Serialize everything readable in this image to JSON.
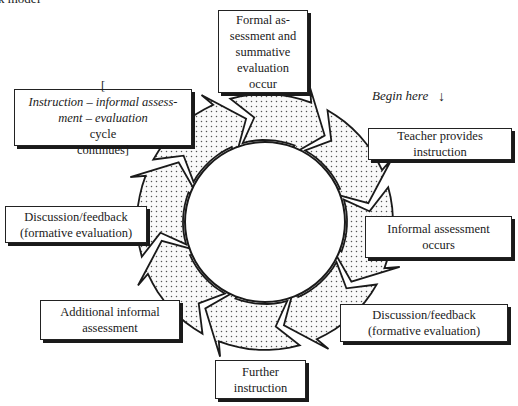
{
  "header": {
    "partial_title": "k model"
  },
  "begin_label": {
    "text": "Begin here",
    "arrow": "↓"
  },
  "center": {
    "label": ""
  },
  "steps": [
    {
      "id": "formal",
      "lines": [
        "Formal as-",
        "sessment and",
        "summative",
        "evaluation",
        "occur"
      ]
    },
    {
      "id": "teacher",
      "lines": [
        "Teacher provides instruction"
      ]
    },
    {
      "id": "informal",
      "lines": [
        "Informal assessment",
        "occurs"
      ]
    },
    {
      "id": "discussion-right",
      "lines": [
        "Discussion/feedback",
        "(formative evaluation)"
      ]
    },
    {
      "id": "further",
      "lines": [
        "Further",
        "instruction"
      ]
    },
    {
      "id": "additional",
      "lines": [
        "Additional informal",
        "assessment"
      ]
    },
    {
      "id": "discussion-left",
      "lines": [
        "Discussion/feedback",
        "(formative evaluation)"
      ]
    },
    {
      "id": "cycle",
      "line1_bracket": "[",
      "line1_italic": "Instruction – informal assess-",
      "line2_italic": "ment – evaluation",
      "line2_plain": " cycle",
      "line3": "continues]"
    }
  ],
  "style": {
    "ring_fill": "#f2f2f2",
    "ring_dot": "#555555",
    "stroke": "#1a1a1a"
  }
}
